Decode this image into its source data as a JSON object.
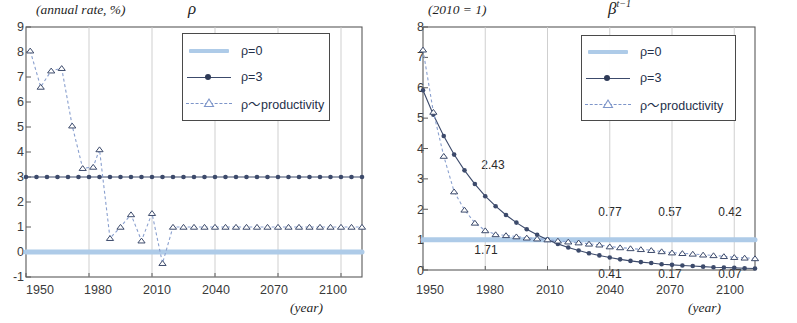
{
  "figure": {
    "panels": [
      "left",
      "right"
    ]
  },
  "left": {
    "unit_caption": "(annual rate, %)",
    "symbol": "ρ",
    "x_axis_caption": "(year)",
    "y_ticks": [
      "9",
      "8",
      "7",
      "6",
      "5",
      "4",
      "3",
      "2",
      "1",
      "0",
      "-1"
    ],
    "x_ticks": [
      "1950",
      "1980",
      "2010",
      "2040",
      "2070",
      "2100"
    ],
    "legend": [
      {
        "label": "ρ=0",
        "key": "thick-light-blue-line"
      },
      {
        "label": "ρ=3",
        "key": "dark-line-filled-circle"
      },
      {
        "label": "ρ～productivity",
        "key": "dashed-line-open-triangle"
      }
    ]
  },
  "right": {
    "unit_caption": "(2010 = 1)",
    "symbol": "β",
    "symbol_exp": "t−1",
    "x_axis_caption": "(year)",
    "y_ticks": [
      "8",
      "7",
      "6",
      "5",
      "4",
      "3",
      "2",
      "1",
      "0"
    ],
    "x_ticks": [
      "1950",
      "1980",
      "2010",
      "2040",
      "2070",
      "2100"
    ],
    "legend": [
      {
        "label": "ρ=0",
        "key": "thick-light-blue-line"
      },
      {
        "label": "ρ=3",
        "key": "dark-line-filled-circle"
      },
      {
        "label": "ρ～productivity",
        "key": "dashed-line-open-triangle"
      }
    ],
    "annotations": [
      {
        "text": "2.43",
        "year": 1988,
        "value": 3.05,
        "series": "rho3"
      },
      {
        "text": "1.71",
        "year": 1988,
        "value": 0.62,
        "series": "productivity"
      },
      {
        "text": "0.77",
        "year": 2040,
        "value": 1.42,
        "series": "productivity"
      },
      {
        "text": "0.57",
        "year": 2070,
        "value": 1.42,
        "series": "productivity"
      },
      {
        "text": "0.42",
        "year": 2100,
        "value": 1.42,
        "series": "productivity"
      },
      {
        "text": "0.41",
        "year": 2040,
        "value": -0.42,
        "series": "rho3"
      },
      {
        "text": "0.17",
        "year": 2070,
        "value": -0.42,
        "series": "rho3"
      },
      {
        "text": "0.07",
        "year": 2100,
        "value": -0.42,
        "series": "rho3"
      }
    ]
  },
  "colors": {
    "rho0": "#aecbe8",
    "rho3": "#3c4a6b",
    "productivity": "#8aa0cf",
    "axis": "#5a5a5a",
    "grid": "#c9c9c9",
    "text": "#2b2b2b"
  },
  "chart_data": [
    {
      "type": "line",
      "id": "left-panel",
      "title": "ρ",
      "subtitle": "(annual rate, %)",
      "xlabel": "(year)",
      "ylabel": "annual rate, %",
      "xlim": [
        1950,
        2110
      ],
      "ylim": [
        -1,
        9
      ],
      "xticks": [
        1950,
        1980,
        2010,
        2040,
        2070,
        2100
      ],
      "yticks": [
        -1,
        0,
        1,
        2,
        3,
        4,
        5,
        6,
        7,
        8,
        9
      ],
      "grid": "vertical",
      "legend_position": "top-center-right",
      "x": [
        1950,
        1955,
        1960,
        1965,
        1970,
        1975,
        1980,
        1985,
        1990,
        1995,
        2000,
        2005,
        2010,
        2015,
        2020,
        2025,
        2030,
        2035,
        2040,
        2045,
        2050,
        2055,
        2060,
        2065,
        2070,
        2075,
        2080,
        2085,
        2090,
        2095,
        2100,
        2105,
        2110
      ],
      "series": [
        {
          "name": "ρ=0",
          "style": "thick-light-blue",
          "values": [
            0,
            0,
            0,
            0,
            0,
            0,
            0,
            0,
            0,
            0,
            0,
            0,
            0,
            0,
            0,
            0,
            0,
            0,
            0,
            0,
            0,
            0,
            0,
            0,
            0,
            0,
            0,
            0,
            0,
            0,
            0,
            0,
            0
          ]
        },
        {
          "name": "ρ=3",
          "style": "dark-line-filled-circle",
          "values": [
            3,
            3,
            3,
            3,
            3,
            3,
            3,
            3,
            3,
            3,
            3,
            3,
            3,
            3,
            3,
            3,
            3,
            3,
            3,
            3,
            3,
            3,
            3,
            3,
            3,
            3,
            3,
            3,
            3,
            3,
            3,
            3,
            3
          ]
        },
        {
          "name": "ρ～productivity",
          "style": "dashed-open-triangle",
          "x": [
            1952,
            1957,
            1962,
            1967,
            1972,
            1977,
            1982,
            1985,
            1990,
            1995,
            2000,
            2005,
            2010,
            2015,
            2020,
            2025,
            2030,
            2035,
            2040,
            2045,
            2050,
            2055,
            2060,
            2065,
            2070,
            2075,
            2080,
            2085,
            2090,
            2095,
            2100,
            2105,
            2110
          ],
          "values": [
            8.05,
            6.6,
            7.25,
            7.35,
            5.05,
            3.35,
            3.4,
            4.1,
            0.55,
            1.0,
            1.5,
            0.45,
            1.55,
            -0.45,
            1.0,
            1.0,
            1.0,
            1.0,
            1.0,
            1.0,
            1.0,
            1.0,
            1.0,
            1.0,
            1.0,
            1.0,
            1.0,
            1.0,
            1.0,
            1.0,
            1.0,
            1.0,
            1.0
          ]
        }
      ]
    },
    {
      "type": "line",
      "id": "right-panel",
      "title": "β^{t−1}",
      "subtitle": "(2010 = 1)",
      "xlabel": "(year)",
      "ylabel": "index, 2010 = 1",
      "xlim": [
        1950,
        2110
      ],
      "ylim": [
        0,
        8
      ],
      "xticks": [
        1950,
        1980,
        2010,
        2040,
        2070,
        2100
      ],
      "yticks": [
        0,
        1,
        2,
        3,
        4,
        5,
        6,
        7,
        8
      ],
      "grid": "vertical",
      "legend_position": "top-center-right",
      "x": [
        1950,
        1955,
        1960,
        1965,
        1970,
        1975,
        1980,
        1985,
        1990,
        1995,
        2000,
        2005,
        2010,
        2015,
        2020,
        2025,
        2030,
        2035,
        2040,
        2045,
        2050,
        2055,
        2060,
        2065,
        2070,
        2075,
        2080,
        2085,
        2090,
        2095,
        2100,
        2105,
        2110
      ],
      "series": [
        {
          "name": "ρ=0",
          "style": "thick-light-blue",
          "values": [
            1,
            1,
            1,
            1,
            1,
            1,
            1,
            1,
            1,
            1,
            1,
            1,
            1,
            1,
            1,
            1,
            1,
            1,
            1,
            1,
            1,
            1,
            1,
            1,
            1,
            1,
            1,
            1,
            1,
            1,
            1,
            1,
            1
          ]
        },
        {
          "name": "ρ=3",
          "style": "dark-line-filled-circle",
          "values": [
            5.92,
            5.11,
            4.41,
            3.8,
            3.28,
            2.83,
            2.43,
            2.1,
            1.81,
            1.56,
            1.34,
            1.16,
            1.0,
            0.86,
            0.74,
            0.64,
            0.55,
            0.48,
            0.41,
            0.35,
            0.3,
            0.26,
            0.23,
            0.19,
            0.17,
            0.15,
            0.13,
            0.11,
            0.09,
            0.08,
            0.07,
            0.06,
            0.05
          ]
        },
        {
          "name": "ρ～productivity",
          "style": "dashed-open-triangle",
          "values": [
            7.25,
            5.2,
            3.75,
            2.58,
            1.98,
            1.55,
            1.3,
            1.17,
            1.14,
            1.1,
            1.06,
            1.03,
            1.0,
            0.96,
            0.93,
            0.9,
            0.86,
            0.83,
            0.77,
            0.74,
            0.71,
            0.68,
            0.65,
            0.61,
            0.57,
            0.55,
            0.53,
            0.5,
            0.48,
            0.45,
            0.42,
            0.4,
            0.38
          ]
        }
      ]
    }
  ]
}
